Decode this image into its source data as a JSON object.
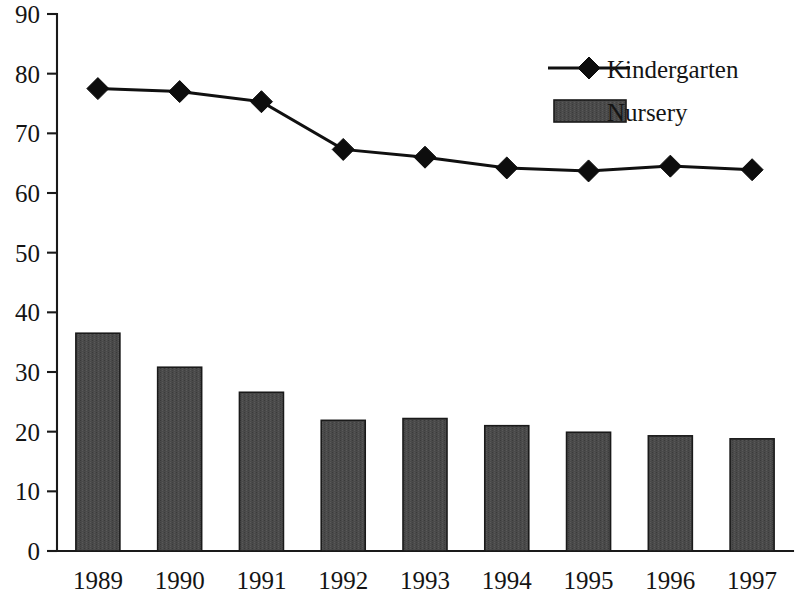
{
  "chart_data": {
    "type": "bar",
    "title": "",
    "subtitle": "",
    "xlabel": "",
    "ylabel": "",
    "categories": [
      "1989",
      "1990",
      "1991",
      "1992",
      "1993",
      "1994",
      "1995",
      "1996",
      "1997"
    ],
    "ylim": [
      0,
      90
    ],
    "ytick_step": 10,
    "yticks": [
      "0",
      "10",
      "20",
      "30",
      "40",
      "50",
      "60",
      "70",
      "80",
      "90"
    ],
    "grid": false,
    "legend_position": "top-right",
    "series": [
      {
        "name": "Kindergarten",
        "type": "line",
        "marker": "diamond",
        "color": "#101010",
        "values": [
          77.5,
          77.0,
          75.3,
          67.3,
          66.0,
          64.2,
          63.7,
          64.5,
          63.9
        ]
      },
      {
        "name": "Nursery",
        "type": "bar",
        "color": "#4a4a4a",
        "values": [
          36.5,
          30.8,
          26.6,
          21.9,
          22.2,
          21.0,
          19.9,
          19.3,
          18.8
        ]
      }
    ]
  },
  "legend": {
    "items": [
      {
        "label": "Kindergarten",
        "marker": "line-diamond"
      },
      {
        "label": "Nursery",
        "marker": "filled-rect"
      }
    ]
  },
  "axes": {
    "y_axis_name": "y-axis",
    "x_axis_name": "x-axis"
  },
  "colors": {
    "bar_fill": "#4a4a4a",
    "line": "#101010",
    "axis": "#1a1a1a",
    "text": "#141414",
    "background": "#ffffff"
  }
}
